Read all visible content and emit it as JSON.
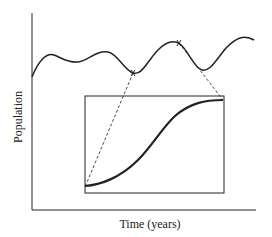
{
  "diagram": {
    "ylabel": "Population",
    "xlabel": "Time (years)",
    "colors": {
      "line": "#222222",
      "background": "#ffffff"
    }
  }
}
